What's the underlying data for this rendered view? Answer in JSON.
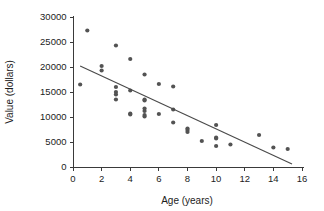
{
  "chart_data": {
    "type": "scatter",
    "title": "",
    "subtitle": "",
    "xlabel": "Age (years)",
    "ylabel": "Value (dollars)",
    "xlim": [
      0,
      16
    ],
    "ylim": [
      0,
      30000
    ],
    "xticks": [
      0,
      2,
      4,
      6,
      8,
      10,
      12,
      14,
      16
    ],
    "xtick_labels": [
      "0",
      "2",
      "4",
      "6",
      "8",
      "10",
      "12",
      "14",
      "16"
    ],
    "yticks": [
      0,
      5000,
      10000,
      15000,
      20000,
      25000,
      30000
    ],
    "ytick_labels": [
      "0",
      "5000",
      "10000",
      "15000",
      "20000",
      "25000",
      "30000"
    ],
    "grid": false,
    "legend": false,
    "legend_position": "none",
    "point_color": "#535353",
    "line_color": "#4a4a4a",
    "axis_color": "#3a3a3a",
    "text_color": "#1c1c1c",
    "background_color": "#ffffff",
    "x": [
      0.5,
      1.0,
      2.0,
      2.0,
      3.0,
      3.0,
      3.0,
      3.0,
      3.0,
      4.0,
      4.0,
      4.0,
      4.0,
      5.0,
      5.0,
      5.0,
      5.0,
      5.0,
      5.0,
      5.0,
      6.0,
      6.0,
      7.0,
      7.0,
      7.0,
      8.0,
      8.0,
      8.0,
      9.0,
      10.0,
      10.0,
      10.0,
      10.0,
      11.0,
      13.0,
      14.0,
      15.0
    ],
    "y": [
      16500,
      27300,
      20200,
      19300,
      24300,
      16000,
      15000,
      14500,
      13500,
      21600,
      15300,
      10700,
      10500,
      18500,
      13500,
      13300,
      11700,
      11200,
      10400,
      10100,
      16600,
      10600,
      16100,
      11500,
      8900,
      7700,
      7400,
      7000,
      5200,
      8400,
      5900,
      5700,
      4200,
      4500,
      6400,
      3900,
      3600
    ],
    "points": [
      {
        "x": 0.5,
        "y": 16500
      },
      {
        "x": 1.0,
        "y": 27300
      },
      {
        "x": 2.0,
        "y": 20200
      },
      {
        "x": 2.0,
        "y": 19300
      },
      {
        "x": 3.0,
        "y": 24300
      },
      {
        "x": 3.0,
        "y": 16000
      },
      {
        "x": 3.0,
        "y": 15000
      },
      {
        "x": 3.0,
        "y": 14500
      },
      {
        "x": 3.0,
        "y": 13500
      },
      {
        "x": 4.0,
        "y": 21600
      },
      {
        "x": 4.0,
        "y": 15300
      },
      {
        "x": 4.0,
        "y": 10700
      },
      {
        "x": 4.0,
        "y": 10500
      },
      {
        "x": 5.0,
        "y": 18500
      },
      {
        "x": 5.0,
        "y": 13500
      },
      {
        "x": 5.0,
        "y": 13300
      },
      {
        "x": 5.0,
        "y": 11700
      },
      {
        "x": 5.0,
        "y": 11200
      },
      {
        "x": 5.0,
        "y": 10400
      },
      {
        "x": 5.0,
        "y": 10100
      },
      {
        "x": 6.0,
        "y": 16600
      },
      {
        "x": 6.0,
        "y": 10600
      },
      {
        "x": 7.0,
        "y": 16100
      },
      {
        "x": 7.0,
        "y": 11500
      },
      {
        "x": 7.0,
        "y": 8900
      },
      {
        "x": 8.0,
        "y": 7700
      },
      {
        "x": 8.0,
        "y": 7400
      },
      {
        "x": 8.0,
        "y": 7000
      },
      {
        "x": 9.0,
        "y": 5200
      },
      {
        "x": 10.0,
        "y": 8400
      },
      {
        "x": 10.0,
        "y": 5900
      },
      {
        "x": 10.0,
        "y": 5700
      },
      {
        "x": 10.0,
        "y": 4200
      },
      {
        "x": 11.0,
        "y": 4500
      },
      {
        "x": 13.0,
        "y": 6400
      },
      {
        "x": 14.0,
        "y": 3900
      },
      {
        "x": 15.0,
        "y": 3600
      }
    ],
    "trend_line": {
      "type": "linear-regression",
      "x_start": 0.5,
      "y_start": 20200,
      "x_end": 15.3,
      "y_end": 600
    },
    "annotations": []
  }
}
